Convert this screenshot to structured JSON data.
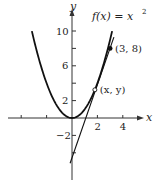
{
  "chart_data": {
    "type": "line",
    "title": "",
    "xlabel": "x",
    "ylabel": "y",
    "xlim": [
      -5,
      5.3
    ],
    "ylim": [
      -7,
      11.5
    ],
    "x_ticks": [
      -4,
      -2,
      2,
      4
    ],
    "x_tick_labels": [
      {
        "value": 2,
        "label": "2"
      },
      {
        "value": 4,
        "label": "4"
      }
    ],
    "y_ticks": [
      -4,
      -2,
      2,
      4,
      6,
      8,
      10
    ],
    "y_tick_labels": [
      {
        "value": 10,
        "label": "10"
      },
      {
        "value": 6,
        "label": "6"
      },
      {
        "value": 2,
        "label": "2"
      },
      {
        "value": -2,
        "label": "−2"
      }
    ],
    "grid": false,
    "series": [
      {
        "name": "f(x) = x^2",
        "kind": "function",
        "expression": "x^2",
        "x_range": [
          -3.16,
          3.16
        ]
      },
      {
        "name": "secant line",
        "kind": "line",
        "points": [
          [
            -0.15,
            -5.2
          ],
          [
            3.3,
            9.3
          ]
        ]
      }
    ],
    "points": [
      {
        "label": "(3, 8)",
        "x": 3,
        "y": 8,
        "style": "filled"
      },
      {
        "label": "(x, y)",
        "x": 1.8,
        "y": 3.24,
        "style": "open"
      }
    ],
    "annotations": [
      {
        "text_main": "f(x) = x",
        "superscript": "2",
        "near": "top-right"
      }
    ]
  }
}
